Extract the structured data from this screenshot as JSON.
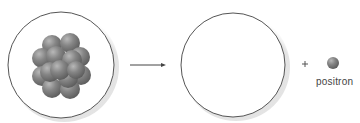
{
  "diagram": {
    "type": "nuclear-decay",
    "elements": {
      "parent_nucleus": {
        "description": "atom containing nucleus cluster",
        "label": ""
      },
      "arrow": {
        "direction": "right"
      },
      "product_atom": {
        "description": "empty circle",
        "label": ""
      },
      "plus_sign": "+",
      "emitted_particle": {
        "label": "positron"
      }
    }
  },
  "colors": {
    "circle_stroke": "#555555",
    "nucleon": "#7a7a7a",
    "nucleon_highlight": "#b0b0b0",
    "positron": "#8a8a8a",
    "text": "#444444"
  }
}
